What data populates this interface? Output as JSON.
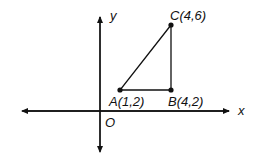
{
  "diagram": {
    "axes": {
      "x_label": "x",
      "y_label": "y",
      "origin_label": "O"
    },
    "points": [
      {
        "name": "A",
        "label": "A(1,2)",
        "x": 1,
        "y": 2
      },
      {
        "name": "B",
        "label": "B(4,2)",
        "x": 4,
        "y": 2
      },
      {
        "name": "C",
        "label": "C(4,6)",
        "x": 4,
        "y": 6
      }
    ],
    "shape": "right triangle ABC",
    "colors": {
      "stroke": "#111111",
      "background": "#ffffff"
    }
  }
}
